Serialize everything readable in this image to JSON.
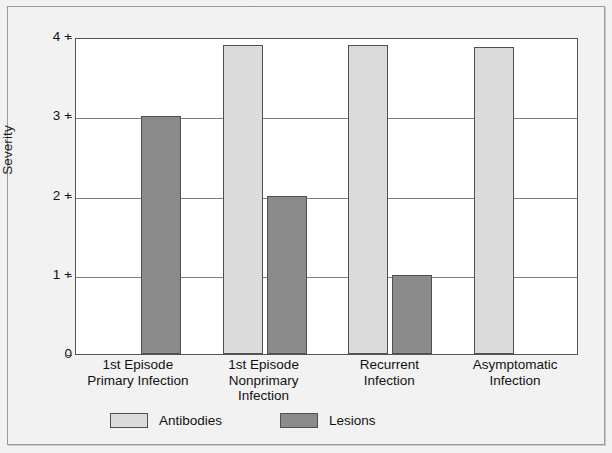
{
  "chart_data": {
    "type": "bar",
    "title": "",
    "xlabel": "",
    "ylabel": "Severity",
    "ylim": [
      0,
      4
    ],
    "grid": true,
    "legend_position": "bottom",
    "categories": [
      "1st Episode Primary Infection",
      "1st Episode Nonprimary Infection",
      "Recurrent Infection",
      "Asymptomatic Infection"
    ],
    "category_lines": [
      [
        "1st Episode",
        "Primary Infection"
      ],
      [
        "1st Episode",
        "Nonprimary",
        "Infection"
      ],
      [
        "Recurrent",
        "Infection"
      ],
      [
        "Asymptomatic",
        "Infection"
      ]
    ],
    "y_ticks": [
      {
        "value": 4,
        "label": "4 +"
      },
      {
        "value": 3,
        "label": "3 +"
      },
      {
        "value": 2,
        "label": "2 +"
      },
      {
        "value": 1,
        "label": "1 +"
      },
      {
        "value": 0,
        "label": "0"
      }
    ],
    "series": [
      {
        "name": "Antibodies",
        "color": "#dcdcdc",
        "values": [
          0,
          3.9,
          3.9,
          3.88
        ]
      },
      {
        "name": "Lesions",
        "color": "#8a8a8a",
        "values": [
          3,
          2,
          1,
          0
        ]
      }
    ],
    "legend": [
      {
        "label": "Antibodies",
        "color": "#dcdcdc"
      },
      {
        "label": "Lesions",
        "color": "#8a8a8a"
      }
    ]
  },
  "axis": {
    "y_title": "Severity"
  }
}
